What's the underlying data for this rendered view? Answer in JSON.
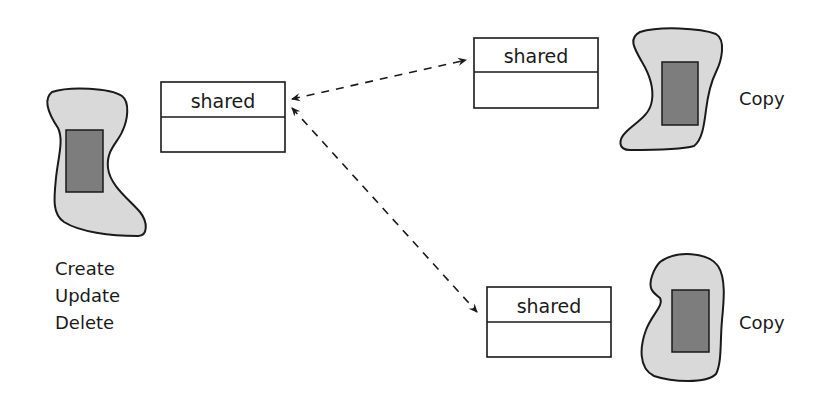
{
  "diagram": {
    "source": {
      "labels": [
        "Create",
        "Update",
        "Delete"
      ],
      "shared_box": {
        "title": "shared"
      }
    },
    "replicas": [
      {
        "shared_box": {
          "title": "shared"
        },
        "label": "Copy"
      },
      {
        "shared_box": {
          "title": "shared"
        },
        "label": "Copy"
      }
    ],
    "connectors": [
      {
        "from": "source.shared_box",
        "to": "replicas.0.shared_box",
        "style": "dashed",
        "direction": "bidirectional"
      },
      {
        "from": "source.shared_box",
        "to": "replicas.1.shared_box",
        "style": "dashed",
        "direction": "bidirectional"
      }
    ],
    "colors": {
      "blob_fill": "#d9d9d9",
      "inner_rect_fill": "#7d7d7d",
      "stroke": "#1a1a1a",
      "background": "#ffffff"
    }
  }
}
